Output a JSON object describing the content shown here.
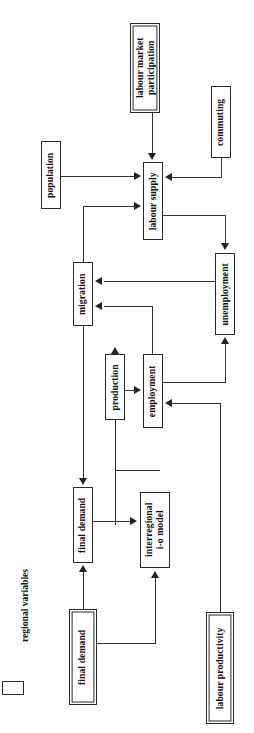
{
  "diagram": {
    "orientation": "rotated-90",
    "legend": {
      "swatch_label": "regional variables"
    },
    "nodes": [
      {
        "id": "labour-market-participation",
        "label": "labour market\nparticipation",
        "type": "exogenous"
      },
      {
        "id": "population",
        "label": "population",
        "type": "regional"
      },
      {
        "id": "commuting",
        "label": "commuting",
        "type": "regional"
      },
      {
        "id": "labour-supply",
        "label": "labour supply",
        "type": "regional"
      },
      {
        "id": "migration",
        "label": "migration",
        "type": "regional"
      },
      {
        "id": "unemployment",
        "label": "unemployment",
        "type": "regional"
      },
      {
        "id": "production",
        "label": "production",
        "type": "regional"
      },
      {
        "id": "employment",
        "label": "employment",
        "type": "regional"
      },
      {
        "id": "final-demand-regional",
        "label": "final demand",
        "type": "regional"
      },
      {
        "id": "interregional-io-model",
        "label": "interregional\ni-o model",
        "type": "regional"
      },
      {
        "id": "final-demand-exogenous",
        "label": "final demand",
        "type": "exogenous"
      },
      {
        "id": "labour-productivity",
        "label": "labour productivity",
        "type": "exogenous"
      }
    ],
    "edges": [
      {
        "from": "labour-market-participation",
        "to": "labour-supply"
      },
      {
        "from": "population",
        "to": "labour-supply"
      },
      {
        "from": "commuting",
        "to": "labour-supply"
      },
      {
        "from": "migration",
        "to": "labour-supply"
      },
      {
        "from": "labour-supply",
        "to": "unemployment"
      },
      {
        "from": "unemployment",
        "to": "migration"
      },
      {
        "from": "employment",
        "to": "migration"
      },
      {
        "from": "employment",
        "to": "unemployment"
      },
      {
        "from": "production",
        "to": "employment"
      },
      {
        "from": "labour-productivity",
        "to": "employment"
      },
      {
        "from": "interregional-io-model",
        "to": "production"
      },
      {
        "from": "final-demand-regional",
        "to": "interregional-io-model"
      },
      {
        "from": "final-demand-exogenous",
        "to": "final-demand-regional"
      },
      {
        "from": "final-demand-exogenous",
        "to": "interregional-io-model"
      },
      {
        "from": "employment",
        "to": "final-demand-regional"
      }
    ],
    "colors": {
      "node_border": "#2b2b2b",
      "connector": "#333333",
      "background": "#ffffff",
      "text": "#111111"
    }
  }
}
